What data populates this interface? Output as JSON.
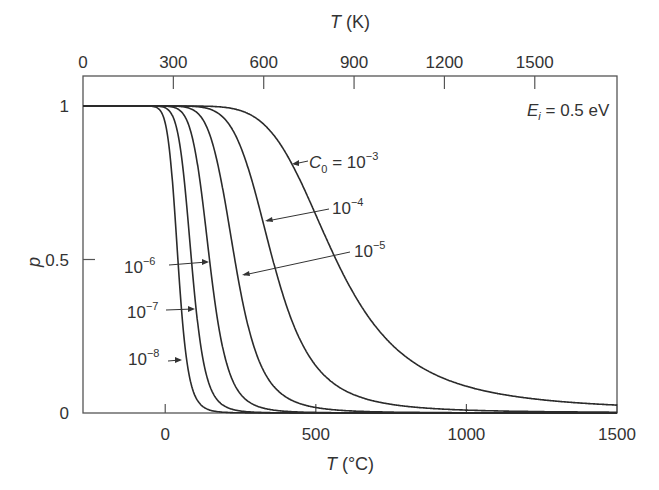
{
  "chart_data": {
    "type": "line",
    "title": "",
    "xlabel": "T (°C)",
    "xlabel_top": "T (K)",
    "ylabel": "p",
    "xlim": [
      -273,
      1500
    ],
    "ylim": [
      0,
      1.1
    ],
    "grid": false,
    "x_ticks": [
      0,
      500,
      1000,
      1500
    ],
    "x_tick_labels": [
      "0",
      "500",
      "1000",
      "1500"
    ],
    "x_top_ticks": [
      0,
      300,
      600,
      900,
      1200,
      1500
    ],
    "x_top_tick_labels": [
      "0",
      "300",
      "600",
      "900",
      "1200",
      "1500"
    ],
    "y_ticks": [
      0,
      0.5,
      1
    ],
    "y_tick_labels": [
      "0",
      "0.5",
      "1"
    ],
    "annotation_energy": "E_i = 0.5 eV",
    "Ei_eV": 0.5,
    "series": [
      {
        "name": "C0 = 10^-3",
        "C0": 0.001,
        "label": "C₀ = 10⁻³",
        "T_half_C": 567
      },
      {
        "name": "C0 = 10^-4",
        "C0": 0.0001,
        "label": "10⁻⁴",
        "T_half_C": 357
      },
      {
        "name": "C0 = 10^-5",
        "C0": 1e-05,
        "label": "10⁻⁵",
        "T_half_C": 231
      },
      {
        "name": "C0 = 10^-6",
        "C0": 1e-06,
        "label": "10⁻⁶",
        "T_half_C": 147
      },
      {
        "name": "C0 = 10^-7",
        "C0": 1e-07,
        "label": "10⁻⁷",
        "T_half_C": 87
      },
      {
        "name": "C0 = 10^-8",
        "C0": 1e-08,
        "label": "10⁻⁸",
        "T_half_C": 42
      }
    ],
    "legend_position": "inline labels with arrows"
  },
  "labels": {
    "top_axis_title_var": "T",
    "top_axis_title_unit": " (K)",
    "bottom_axis_title_var": "T",
    "bottom_axis_title_unit": " (°C)",
    "y_axis_title": "p",
    "energy_var": "E",
    "energy_sub": "i",
    "energy_rest": " = 0.5 eV",
    "c0_var": "C",
    "c0_sub": "0",
    "c0_rest": " = 10",
    "c0_exp": "−3",
    "l4_base": "10",
    "l4_exp": "−4",
    "l5_base": "10",
    "l5_exp": "−5",
    "l6_base": "10",
    "l6_exp": "−6",
    "l7_base": "10",
    "l7_exp": "−7",
    "l8_base": "10",
    "l8_exp": "−8"
  },
  "colors": {
    "line": "#2b2b2b",
    "axis": "#4a4a4a",
    "text": "#333333"
  }
}
